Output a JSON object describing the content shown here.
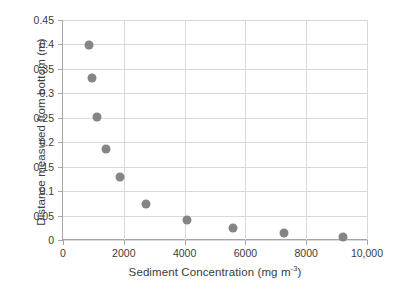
{
  "chart_data": {
    "type": "scatter",
    "title": "",
    "xlabel_text": "Sediment Concentration (mg m",
    "xlabel_sup": "-3",
    "xlabel_tail": ")",
    "ylabel": "Distance measured from bottom (m)",
    "xlim": [
      0,
      10000
    ],
    "ylim": [
      0,
      0.45
    ],
    "grid": true,
    "legend": "none",
    "marker_color": "#858585",
    "gridline_color": "#d9d9d9",
    "axis_color": "#a6a6a6",
    "text_color": "#3b3b3b",
    "background_color": "#ffffff",
    "xticks": [
      0,
      2000,
      4000,
      6000,
      8000,
      10000
    ],
    "xtick_labels": [
      "0",
      "2000",
      "4000",
      "6000",
      "8000",
      "10,000"
    ],
    "yticks": [
      0,
      0.05,
      0.1,
      0.15,
      0.2,
      0.25,
      0.3,
      0.35,
      0.4,
      0.45
    ],
    "ytick_labels": [
      "0",
      "0.05",
      "0.1",
      "0.15",
      "0.2",
      "0.25",
      "0.3",
      "0.35",
      "0.4",
      "0.45"
    ],
    "series": [
      {
        "name": "Sediment profile",
        "x": [
          860,
          950,
          1130,
          1420,
          1860,
          2730,
          4080,
          5580,
          7260,
          9210
        ],
        "y": [
          0.399,
          0.332,
          0.252,
          0.187,
          0.128,
          0.073,
          0.04,
          0.024,
          0.014,
          0.006
        ]
      }
    ]
  }
}
